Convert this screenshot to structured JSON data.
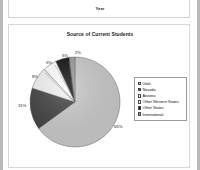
{
  "top_chart": {
    "axis_title": "Year",
    "tick_labels": [
      "",
      "",
      "",
      "",
      "",
      "",
      "",
      ""
    ]
  },
  "chart_data": {
    "type": "pie",
    "title": "Source of Current Students",
    "categories": [
      "Utah",
      "Nevada",
      "Arizona",
      "Other Western States",
      "Other States",
      "International"
    ],
    "values": [
      65,
      15,
      8,
      5,
      5,
      2
    ],
    "value_labels": [
      "65%",
      "15%",
      "8%",
      "5%",
      "5%",
      "2%"
    ],
    "colors": [
      "#c8c8c8",
      "#3f3f3f",
      "#f2f2f2",
      "#ffffff",
      "#0d0d0d",
      "#9a9a9a"
    ],
    "legend_position": "right",
    "xlabel": "",
    "ylabel": ""
  }
}
